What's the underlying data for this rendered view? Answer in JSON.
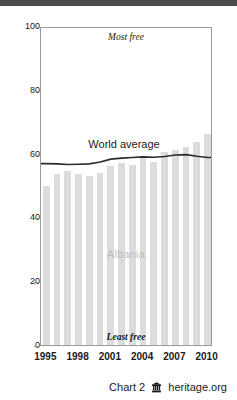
{
  "chart_data": {
    "type": "bar",
    "title": "",
    "xlabel": "",
    "ylabel": "",
    "ylim": [
      0,
      100
    ],
    "xlim": [
      1995,
      2010
    ],
    "grid": false,
    "legend_position": "inline-annotation",
    "categories": [
      1995,
      1996,
      1997,
      1998,
      1999,
      2000,
      2001,
      2002,
      2003,
      2004,
      2005,
      2006,
      2007,
      2008,
      2009,
      2010
    ],
    "series": [
      {
        "name": "Albania",
        "type": "bar",
        "color": "#dcdcdc",
        "values": [
          50.0,
          53.5,
          54.5,
          53.5,
          53.0,
          54.0,
          56.0,
          57.0,
          56.5,
          58.5,
          57.5,
          60.5,
          61.0,
          62.0,
          63.5,
          66.0
        ]
      },
      {
        "name": "World average",
        "type": "line",
        "color": "#2b2b2b",
        "values": [
          57.5,
          57.4,
          57.2,
          57.3,
          57.4,
          58.0,
          58.9,
          59.2,
          59.4,
          59.6,
          59.5,
          59.7,
          60.2,
          60.3,
          59.8,
          59.4
        ]
      }
    ],
    "y_ticks": [
      0,
      20,
      40,
      60,
      80,
      100
    ],
    "x_ticks": [
      1995,
      1998,
      2001,
      2004,
      2007,
      2010
    ],
    "annotations": {
      "most_free": "Most free",
      "least_free": "Least free",
      "world_average": "World average",
      "albania": "Albania"
    }
  },
  "footer": {
    "chart_label": "Chart 2",
    "logo_icon": "heritage-building-icon",
    "source": "heritage.org"
  },
  "colors": {
    "bar": "#dcdcdc",
    "line": "#2b2b2b",
    "axis": "#9a9a9a",
    "text": "#1a1a1a",
    "albania_label": "#b9b9b9",
    "topbar": "#4d4d4d"
  }
}
